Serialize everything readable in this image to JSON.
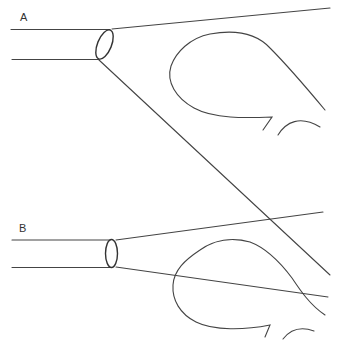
{
  "figure": {
    "panels": [
      {
        "id": "A",
        "label": "A",
        "description": "Tube with angled (oblique) aperture producing a wide, asymmetric cone; lower ray passes below the balloon-shaped outline."
      },
      {
        "id": "B",
        "label": "B",
        "description": "Tube with perpendicular aperture producing a narrower cone; lower ray crosses through the balloon-shaped outline."
      }
    ],
    "colors": {
      "line": "#444444",
      "background": "#ffffff"
    }
  }
}
